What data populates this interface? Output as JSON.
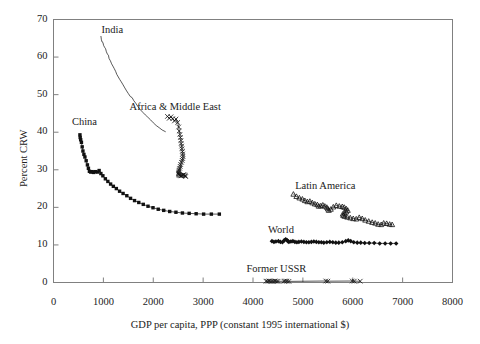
{
  "chart_data": {
    "type": "scatter",
    "title": "",
    "xlabel": "GDP per capita, PPP (constant 1995 international $)",
    "ylabel": "Percent CRW",
    "xlim": [
      0,
      8000
    ],
    "ylim": [
      0,
      70
    ],
    "xticks": [
      0,
      1000,
      2000,
      3000,
      4000,
      5000,
      6000,
      7000,
      8000
    ],
    "yticks": [
      0,
      10,
      20,
      30,
      40,
      50,
      60,
      70
    ],
    "xtick_labels": [
      "0",
      "1000",
      "2000",
      "3000",
      "4000",
      "5000",
      "6000",
      "7000",
      "8000"
    ],
    "ytick_labels": [
      "0",
      "10",
      "20",
      "30",
      "40",
      "50",
      "60",
      "70"
    ],
    "grid": false,
    "legend_position": "inline-annotations",
    "frame": "box",
    "series": [
      {
        "name": "India",
        "label": "India",
        "marker": "none",
        "label_x": 1180,
        "label_y": 67.0,
        "points": [
          [
            950,
            65.6
          ],
          [
            960,
            64.6
          ],
          [
            975,
            64.0
          ],
          [
            990,
            63.9
          ],
          [
            1005,
            63.1
          ],
          [
            1025,
            62.6
          ],
          [
            1045,
            62.2
          ],
          [
            1060,
            61.4
          ],
          [
            1080,
            60.8
          ],
          [
            1100,
            60.5
          ],
          [
            1115,
            59.6
          ],
          [
            1140,
            59.0
          ],
          [
            1165,
            58.2
          ],
          [
            1190,
            57.6
          ],
          [
            1215,
            57.0
          ],
          [
            1245,
            56.2
          ],
          [
            1270,
            55.4
          ],
          [
            1300,
            54.7
          ],
          [
            1330,
            54.0
          ],
          [
            1360,
            53.4
          ],
          [
            1395,
            52.6
          ],
          [
            1430,
            51.8
          ],
          [
            1465,
            51.0
          ],
          [
            1500,
            50.3
          ],
          [
            1540,
            49.5
          ],
          [
            1575,
            49.2
          ],
          [
            1610,
            48.4
          ],
          [
            1650,
            47.7
          ],
          [
            1695,
            46.8
          ],
          [
            1740,
            46.0
          ],
          [
            1790,
            45.3
          ],
          [
            1840,
            44.6
          ],
          [
            1890,
            44.0
          ],
          [
            1945,
            43.3
          ],
          [
            2000,
            42.5
          ],
          [
            2060,
            41.8
          ],
          [
            2120,
            41.2
          ],
          [
            2180,
            40.6
          ],
          [
            2250,
            40.1
          ]
        ]
      },
      {
        "name": "China",
        "label": "China",
        "marker": "filled-square",
        "label_x": 620,
        "label_y": 42.5,
        "points": [
          [
            530,
            39.3
          ],
          [
            535,
            38.6
          ],
          [
            545,
            38.0
          ],
          [
            560,
            37.3
          ],
          [
            575,
            36.1
          ],
          [
            590,
            35.0
          ],
          [
            610,
            34.1
          ],
          [
            630,
            33.4
          ],
          [
            655,
            32.4
          ],
          [
            680,
            31.3
          ],
          [
            700,
            30.4
          ],
          [
            720,
            29.6
          ],
          [
            745,
            29.4
          ],
          [
            775,
            29.5
          ],
          [
            805,
            29.3
          ],
          [
            840,
            29.5
          ],
          [
            880,
            29.4
          ],
          [
            915,
            29.8
          ],
          [
            950,
            29.0
          ],
          [
            990,
            28.4
          ],
          [
            1040,
            27.6
          ],
          [
            1090,
            26.9
          ],
          [
            1145,
            26.2
          ],
          [
            1200,
            25.6
          ],
          [
            1260,
            25.0
          ],
          [
            1325,
            24.3
          ],
          [
            1395,
            23.7
          ],
          [
            1470,
            23.1
          ],
          [
            1545,
            22.4
          ],
          [
            1625,
            21.8
          ],
          [
            1710,
            21.3
          ],
          [
            1800,
            20.8
          ],
          [
            1895,
            20.3
          ],
          [
            1995,
            19.9
          ],
          [
            2100,
            19.5
          ],
          [
            2210,
            19.2
          ],
          [
            2330,
            18.9
          ],
          [
            2455,
            18.7
          ],
          [
            2585,
            18.5
          ],
          [
            2720,
            18.4
          ],
          [
            2860,
            18.3
          ],
          [
            3010,
            18.2
          ],
          [
            3165,
            18.2
          ],
          [
            3325,
            18.2
          ]
        ]
      },
      {
        "name": "Africa & Middle East",
        "label": "Africa & Middle East",
        "marker": "cross",
        "label_x": 2440,
        "label_y": 46.5,
        "points": [
          [
            2285,
            44.2
          ],
          [
            2320,
            43.7
          ],
          [
            2355,
            44.1
          ],
          [
            2390,
            43.6
          ],
          [
            2425,
            43.0
          ],
          [
            2455,
            43.5
          ],
          [
            2490,
            42.6
          ],
          [
            2510,
            41.4
          ],
          [
            2520,
            40.3
          ],
          [
            2535,
            39.4
          ],
          [
            2545,
            38.6
          ],
          [
            2555,
            37.8
          ],
          [
            2560,
            37.0
          ],
          [
            2570,
            36.3
          ],
          [
            2575,
            35.6
          ],
          [
            2585,
            34.9
          ],
          [
            2590,
            34.2
          ],
          [
            2595,
            33.6
          ],
          [
            2590,
            33.0
          ],
          [
            2580,
            32.5
          ],
          [
            2565,
            32.0
          ],
          [
            2550,
            31.4
          ],
          [
            2540,
            30.9
          ],
          [
            2530,
            30.4
          ],
          [
            2520,
            30.0
          ],
          [
            2515,
            29.6
          ],
          [
            2510,
            29.3
          ],
          [
            2505,
            29.0
          ],
          [
            2510,
            28.8
          ],
          [
            2520,
            28.6
          ],
          [
            2535,
            28.5
          ],
          [
            2550,
            28.4
          ],
          [
            2565,
            28.4
          ],
          [
            2580,
            28.5
          ],
          [
            2595,
            28.6
          ],
          [
            2610,
            28.7
          ],
          [
            2625,
            28.6
          ],
          [
            2640,
            28.4
          ],
          [
            2650,
            28.2
          ]
        ]
      },
      {
        "name": "Latin America",
        "label": "Latin America",
        "marker": "open-triangle",
        "label_x": 5450,
        "label_y": 25.5,
        "points": [
          [
            4810,
            23.5
          ],
          [
            4870,
            22.9
          ],
          [
            4930,
            22.5
          ],
          [
            4990,
            22.2
          ],
          [
            5040,
            21.8
          ],
          [
            5090,
            21.5
          ],
          [
            5140,
            21.6
          ],
          [
            5190,
            21.2
          ],
          [
            5240,
            20.9
          ],
          [
            5290,
            20.7
          ],
          [
            5320,
            20.3
          ],
          [
            5360,
            20.4
          ],
          [
            5400,
            20.6
          ],
          [
            5440,
            20.3
          ],
          [
            5480,
            20.0
          ],
          [
            5500,
            19.6
          ],
          [
            5520,
            19.2
          ],
          [
            5560,
            19.5
          ],
          [
            5610,
            20.1
          ],
          [
            5670,
            20.5
          ],
          [
            5730,
            20.3
          ],
          [
            5790,
            20.2
          ],
          [
            5830,
            20.0
          ],
          [
            5870,
            19.6
          ],
          [
            5900,
            19.2
          ],
          [
            5870,
            18.8
          ],
          [
            5830,
            18.5
          ],
          [
            5800,
            18.2
          ],
          [
            5810,
            17.8
          ],
          [
            5840,
            17.6
          ],
          [
            5890,
            17.4
          ],
          [
            5950,
            17.2
          ],
          [
            6010,
            17.0
          ],
          [
            6070,
            16.9
          ],
          [
            6130,
            17.3
          ],
          [
            6190,
            17.0
          ],
          [
            6250,
            16.6
          ],
          [
            6320,
            16.3
          ],
          [
            6390,
            16.0
          ],
          [
            6450,
            15.8
          ],
          [
            6510,
            15.5
          ],
          [
            6570,
            15.4
          ],
          [
            6620,
            15.8
          ],
          [
            6680,
            15.7
          ],
          [
            6740,
            15.5
          ],
          [
            6790,
            15.4
          ]
        ]
      },
      {
        "name": "World",
        "label": "World",
        "marker": "filled-diamond",
        "label_x": 4560,
        "label_y": 13.6,
        "points": [
          [
            4380,
            11.0
          ],
          [
            4420,
            10.8
          ],
          [
            4460,
            10.9
          ],
          [
            4510,
            11.0
          ],
          [
            4550,
            10.8
          ],
          [
            4590,
            10.7
          ],
          [
            4625,
            11.2
          ],
          [
            4655,
            11.5
          ],
          [
            4680,
            11.3
          ],
          [
            4700,
            11.0
          ],
          [
            4720,
            10.8
          ],
          [
            4760,
            10.9
          ],
          [
            4800,
            11.0
          ],
          [
            4840,
            10.8
          ],
          [
            4880,
            10.7
          ],
          [
            4920,
            10.8
          ],
          [
            4970,
            10.9
          ],
          [
            5020,
            10.8
          ],
          [
            5070,
            10.7
          ],
          [
            5120,
            10.7
          ],
          [
            5170,
            10.8
          ],
          [
            5220,
            10.9
          ],
          [
            5270,
            10.8
          ],
          [
            5320,
            10.7
          ],
          [
            5370,
            10.7
          ],
          [
            5420,
            10.6
          ],
          [
            5480,
            10.7
          ],
          [
            5540,
            10.8
          ],
          [
            5600,
            10.7
          ],
          [
            5660,
            10.6
          ],
          [
            5720,
            10.6
          ],
          [
            5790,
            10.7
          ],
          [
            5860,
            11.0
          ],
          [
            5910,
            11.2
          ],
          [
            5960,
            11.0
          ],
          [
            6020,
            10.7
          ],
          [
            6090,
            10.6
          ],
          [
            6160,
            10.6
          ],
          [
            6240,
            10.5
          ],
          [
            6330,
            10.5
          ],
          [
            6430,
            10.5
          ],
          [
            6540,
            10.4
          ],
          [
            6650,
            10.4
          ],
          [
            6760,
            10.4
          ],
          [
            6870,
            10.4
          ]
        ]
      },
      {
        "name": "Former USSR",
        "label": "Former USSR",
        "marker": "cross",
        "label_x": 4470,
        "label_y": 3.4,
        "points": [
          [
            4260,
            0.35
          ],
          [
            4290,
            0.35
          ],
          [
            4320,
            0.4
          ],
          [
            4350,
            0.35
          ],
          [
            4380,
            0.3
          ],
          [
            4410,
            0.35
          ],
          [
            4440,
            0.4
          ],
          [
            4470,
            0.35
          ],
          [
            4500,
            0.3
          ],
          [
            4620,
            0.35
          ],
          [
            4650,
            0.4
          ],
          [
            4680,
            0.35
          ],
          [
            4720,
            0.3
          ],
          [
            5460,
            0.4
          ],
          [
            5500,
            0.35
          ],
          [
            5990,
            0.4
          ],
          [
            6030,
            0.35
          ],
          [
            6150,
            0.35
          ]
        ]
      }
    ]
  },
  "axis": {
    "x_title": "GDP per capita, PPP (constant 1995 international $)",
    "y_title": "Percent CRW"
  }
}
